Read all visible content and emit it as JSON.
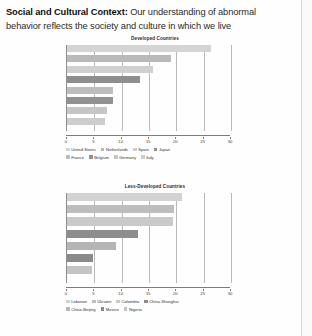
{
  "heading": {
    "lead": "Social and Cultural Context:",
    "rest": " Our understanding of abnormal behavior reflects the society and culture in which we live"
  },
  "axis": {
    "ticks": [
      "0",
      "5",
      "10",
      "15",
      "20",
      "25",
      "30"
    ],
    "min": 0,
    "max": 30
  },
  "colors": {
    "bar_light": "#d0d0d0",
    "bar_mid": "#b4b4b4",
    "bar_dark": "#8e8e8e",
    "bar_darker": "#7b7b7b",
    "gridline": "#b9b9b9",
    "axis": "#7d7d7d",
    "text": "#333333"
  },
  "chart_data": [
    {
      "type": "bar",
      "orientation": "horizontal",
      "title": "Developed Countries",
      "xlabel": "",
      "ylabel": "",
      "xlim": [
        0,
        30
      ],
      "grid": true,
      "legend_position": "bottom",
      "categories": [
        "United States",
        "Netherlands",
        "Spain",
        "Japan",
        "France",
        "Belgium",
        "Germany",
        "Italy"
      ],
      "values": [
        26.4,
        19.1,
        15.7,
        13.4,
        8.5,
        8.4,
        7.3,
        7.0
      ],
      "bar_colors": [
        "#d4d4d4",
        "#b9b9b9",
        "#cfcfcf",
        "#8e8e8e",
        "#bdbdbd",
        "#919191",
        "#c6c6c6",
        "#cdcdcd"
      ]
    },
    {
      "type": "bar",
      "orientation": "horizontal",
      "title": "Less-Developed Countries",
      "xlabel": "",
      "ylabel": "",
      "xlim": [
        0,
        30
      ],
      "grid": true,
      "legend_position": "bottom",
      "categories": [
        "Lebanon",
        "Ukraine",
        "Colombia",
        "China-Shanghai",
        "China-Beijing",
        "Mexico",
        "Nigeria"
      ],
      "values": [
        21.0,
        19.6,
        19.3,
        13.0,
        9.0,
        4.8,
        4.5
      ],
      "bar_colors": [
        "#d2d2d2",
        "#bdbdbd",
        "#c9c9c9",
        "#8d8d8d",
        "#b5b5b5",
        "#8a8a8a",
        "#c4c4c4"
      ]
    }
  ]
}
